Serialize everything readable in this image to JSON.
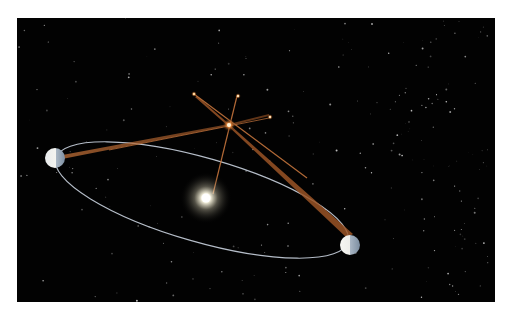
{
  "figure": {
    "title": "",
    "colors": {
      "background": "#020202",
      "frame": "#ffffff",
      "orbit": "#c9d2de",
      "sightline": "#b8642a",
      "star_glow": "#f4a860",
      "sun_core": "#ffffff",
      "sun_glow": "#fff6d8",
      "earth_lit": "#f2f2ee",
      "earth_dark": "#8fa2b6"
    },
    "objects": {
      "sun": {
        "label": ""
      },
      "earth_left": {
        "label": ""
      },
      "earth_right": {
        "label": ""
      },
      "near_star": {
        "label": ""
      },
      "background_stars_marked": 3
    }
  }
}
